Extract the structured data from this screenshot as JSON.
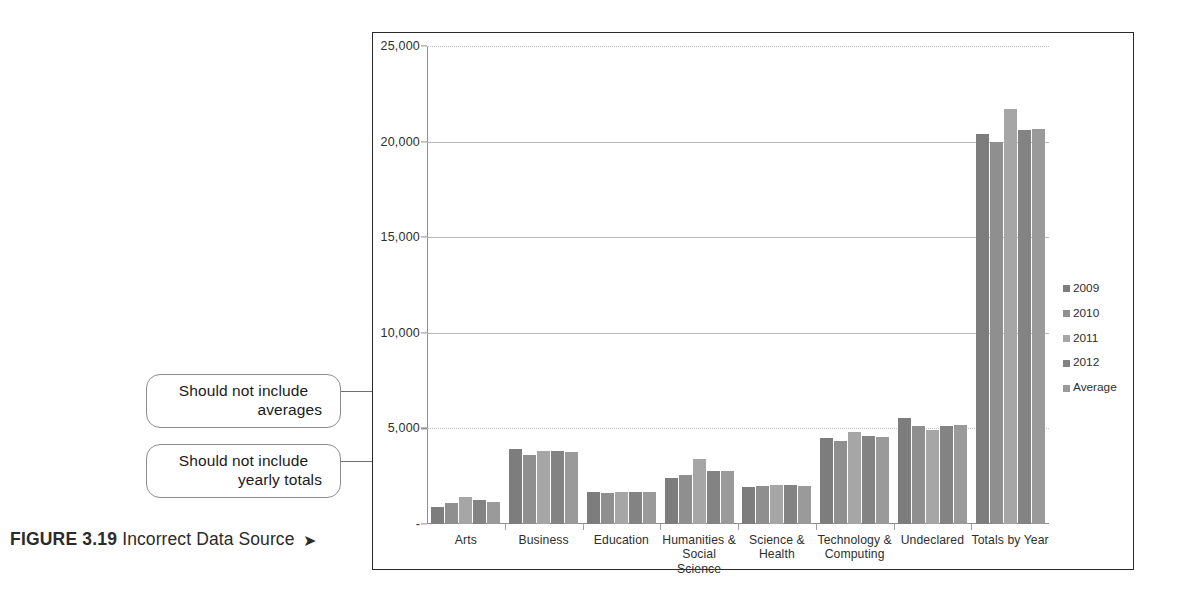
{
  "figure": {
    "number": "FIGURE 3.19",
    "title": "Incorrect Data Source",
    "arrow_glyph": "➤"
  },
  "callouts": [
    {
      "id": "averages",
      "line1": "Should not include",
      "line2": "averages"
    },
    {
      "id": "totals",
      "line1": "Should not include",
      "line2": "yearly totals"
    }
  ],
  "legend": {
    "position": "right",
    "items": [
      {
        "label": "2009",
        "color": "#7d7d7d"
      },
      {
        "label": "2010",
        "color": "#8f8f8f"
      },
      {
        "label": "2011",
        "color": "#a6a6a6"
      },
      {
        "label": "2012",
        "color": "#838383"
      },
      {
        "label": "Average",
        "color": "#9a9a9a"
      }
    ]
  },
  "chart_data": {
    "type": "bar",
    "title": "",
    "subtitle": "",
    "xlabel": "",
    "ylabel": "",
    "ylim": [
      0,
      25000
    ],
    "yticks": [
      0,
      5000,
      10000,
      15000,
      20000,
      25000
    ],
    "ytick_labels": [
      "-",
      "5,000",
      "10,000",
      "15,000",
      "20,000",
      "25,000"
    ],
    "grid": true,
    "legend_position": "right",
    "categories": [
      "Arts",
      "Business",
      "Education",
      "Humanities &\nSocial Science",
      "Science &\nHealth",
      "Technology &\nComputing",
      "Undeclared",
      "Totals by Year"
    ],
    "series": [
      {
        "name": "2009",
        "color": "#7d7d7d",
        "values": [
          900,
          3900,
          1700,
          2400,
          1950,
          4500,
          5550,
          20400
        ]
      },
      {
        "name": "2010",
        "color": "#8f8f8f",
        "values": [
          1100,
          3600,
          1600,
          2550,
          2000,
          4350,
          5150,
          20000
        ]
      },
      {
        "name": "2011",
        "color": "#a6a6a6",
        "values": [
          1400,
          3800,
          1700,
          3400,
          2050,
          4800,
          4900,
          21700
        ]
      },
      {
        "name": "2012",
        "color": "#838383",
        "values": [
          1250,
          3800,
          1650,
          2750,
          2050,
          4600,
          5150,
          20600
        ]
      },
      {
        "name": "Average",
        "color": "#9a9a9a",
        "values": [
          1163,
          3775,
          1663,
          2775,
          2013,
          4563,
          5188,
          20675
        ]
      }
    ]
  }
}
